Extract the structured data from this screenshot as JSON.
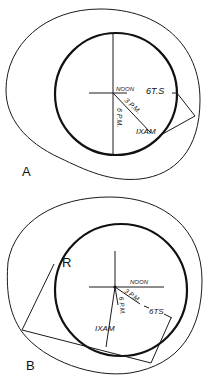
{
  "figure": {
    "panels": [
      {
        "id": "A",
        "label": "A",
        "annotations": {
          "noon": "NOON",
          "gts": "6T.S",
          "pm3": "3 P.M.",
          "pm6": "6 P.M.",
          "am": "IXAM"
        }
      },
      {
        "id": "B",
        "label": "B",
        "annotations": {
          "r": "R",
          "noon": "NOON",
          "gts": "6TS",
          "pm3": "3 P.M.",
          "pm6": "6 P.M.",
          "am": "IXAM"
        }
      }
    ]
  }
}
